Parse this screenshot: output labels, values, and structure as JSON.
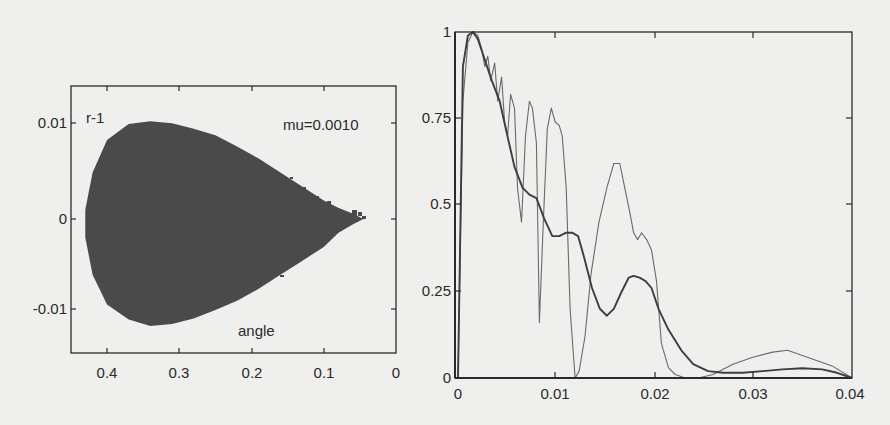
{
  "figure": {
    "left_panel": {
      "type": "scatter",
      "annotation_ylabel": "r-1",
      "annotation_param": "mu=0.0010",
      "xlabel": "angle",
      "xticks": [
        "0.4",
        "0.3",
        "0.2",
        "0.1",
        "0"
      ],
      "yticks": [
        "0.01",
        "0",
        "-0.01"
      ],
      "fill_color": "#4a4a4a"
    },
    "right_panel": {
      "type": "line",
      "xticks": [
        "0",
        "0.01",
        "0.02",
        "0.03",
        "0.04"
      ],
      "yticks": [
        "1",
        "0.75",
        "0.5",
        "0.25",
        "0"
      ],
      "line_color": "#555555"
    }
  },
  "chart_data": [
    {
      "type": "scatter",
      "title": "",
      "xlabel": "angle",
      "ylabel": "r-1",
      "annotation": "mu=0.0010",
      "xlim": [
        0.45,
        0.0
      ],
      "ylim": [
        -0.0147,
        0.0147
      ],
      "x_reversed": true,
      "grid": false,
      "description": "Dense filled teardrop-shaped region of points; rounded on the left (angle~0.43), tapering to a point near angle~0.04, r-1 ~ 0.",
      "outline": {
        "x": [
          0.43,
          0.42,
          0.4,
          0.37,
          0.34,
          0.31,
          0.28,
          0.25,
          0.22,
          0.19,
          0.16,
          0.13,
          0.1,
          0.08,
          0.06,
          0.045,
          0.06,
          0.08,
          0.1,
          0.13,
          0.16,
          0.19,
          0.22,
          0.25,
          0.28,
          0.31,
          0.34,
          0.37,
          0.4,
          0.42,
          0.43
        ],
        "y": [
          0.001,
          0.005,
          0.0085,
          0.0102,
          0.0105,
          0.0103,
          0.0097,
          0.009,
          0.0078,
          0.0065,
          0.005,
          0.0035,
          0.002,
          0.0012,
          0.0006,
          0.0,
          -0.0006,
          -0.0015,
          -0.003,
          -0.0045,
          -0.006,
          -0.0075,
          -0.0088,
          -0.0098,
          -0.0107,
          -0.0113,
          -0.0115,
          -0.0108,
          -0.0092,
          -0.006,
          -0.002
        ]
      }
    },
    {
      "type": "line",
      "title": "",
      "xlabel": "",
      "ylabel": "",
      "xlim": [
        0,
        0.04
      ],
      "ylim": [
        0,
        1
      ],
      "grid": false,
      "series": [
        {
          "name": "thin oscillating curve",
          "x": [
            0.0003,
            0.0008,
            0.0013,
            0.0018,
            0.0023,
            0.0027,
            0.003,
            0.0033,
            0.0036,
            0.004,
            0.0043,
            0.0047,
            0.005,
            0.0053,
            0.0056,
            0.006,
            0.0063,
            0.0067,
            0.0071,
            0.0075,
            0.0078,
            0.0082,
            0.0085,
            0.0089,
            0.0093,
            0.0097,
            0.0101,
            0.0105,
            0.0108,
            0.0112,
            0.0116,
            0.0121,
            0.0125,
            0.0131,
            0.0137,
            0.0145,
            0.0153,
            0.016,
            0.0166,
            0.0171,
            0.0176,
            0.018,
            0.0184,
            0.0188,
            0.0193,
            0.0198,
            0.0203,
            0.0208,
            0.0215,
            0.0222,
            0.0232,
            0.0245,
            0.026,
            0.028,
            0.03,
            0.032,
            0.0335,
            0.0345,
            0.036,
            0.038,
            0.04
          ],
          "y": [
            0.0,
            0.8,
            0.97,
            1.0,
            0.99,
            0.95,
            0.9,
            0.93,
            0.86,
            0.91,
            0.8,
            0.87,
            0.74,
            0.7,
            0.82,
            0.78,
            0.55,
            0.45,
            0.7,
            0.8,
            0.78,
            0.68,
            0.16,
            0.45,
            0.72,
            0.78,
            0.74,
            0.73,
            0.7,
            0.55,
            0.2,
            0.0,
            0.02,
            0.12,
            0.3,
            0.45,
            0.55,
            0.62,
            0.62,
            0.55,
            0.48,
            0.42,
            0.4,
            0.42,
            0.4,
            0.37,
            0.28,
            0.1,
            0.03,
            0.01,
            0.0,
            0.0,
            0.01,
            0.04,
            0.06,
            0.075,
            0.08,
            0.07,
            0.055,
            0.035,
            0.0
          ]
        },
        {
          "name": "thick smooth curve",
          "x": [
            0.0003,
            0.0008,
            0.0013,
            0.0018,
            0.0023,
            0.003,
            0.0037,
            0.0045,
            0.0052,
            0.006,
            0.0068,
            0.0075,
            0.0082,
            0.009,
            0.0098,
            0.0105,
            0.0112,
            0.0118,
            0.0124,
            0.013,
            0.0138,
            0.0146,
            0.0153,
            0.016,
            0.0168,
            0.0175,
            0.018,
            0.0186,
            0.0192,
            0.0198,
            0.0205,
            0.0215,
            0.0228,
            0.024,
            0.0255,
            0.027,
            0.029,
            0.031,
            0.033,
            0.035,
            0.037,
            0.0385,
            0.04
          ],
          "y": [
            0.0,
            0.9,
            0.99,
            1.0,
            0.98,
            0.92,
            0.86,
            0.8,
            0.71,
            0.61,
            0.55,
            0.53,
            0.52,
            0.46,
            0.41,
            0.41,
            0.42,
            0.42,
            0.41,
            0.35,
            0.26,
            0.2,
            0.18,
            0.2,
            0.25,
            0.29,
            0.295,
            0.29,
            0.28,
            0.26,
            0.2,
            0.14,
            0.08,
            0.04,
            0.02,
            0.015,
            0.015,
            0.02,
            0.025,
            0.028,
            0.025,
            0.015,
            0.0
          ]
        }
      ]
    }
  ]
}
